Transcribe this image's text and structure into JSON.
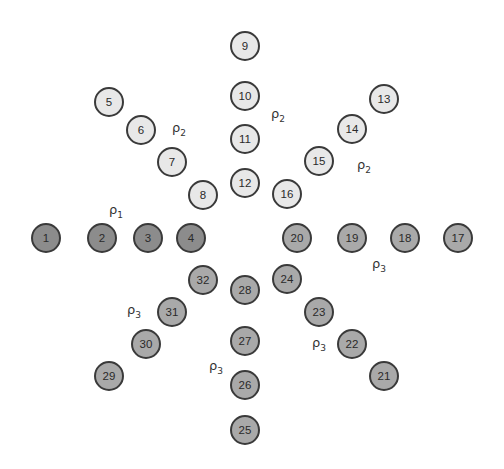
{
  "diagram": {
    "nodes": [
      {
        "id": "1",
        "x": 46,
        "y": 238,
        "shade": "dark"
      },
      {
        "id": "2",
        "x": 102,
        "y": 238,
        "shade": "dark"
      },
      {
        "id": "3",
        "x": 148,
        "y": 238,
        "shade": "dark"
      },
      {
        "id": "4",
        "x": 191,
        "y": 238,
        "shade": "dark"
      },
      {
        "id": "5",
        "x": 109,
        "y": 102,
        "shade": "light"
      },
      {
        "id": "6",
        "x": 141,
        "y": 130,
        "shade": "light"
      },
      {
        "id": "7",
        "x": 172,
        "y": 162,
        "shade": "light"
      },
      {
        "id": "8",
        "x": 203,
        "y": 195,
        "shade": "light"
      },
      {
        "id": "9",
        "x": 245,
        "y": 46,
        "shade": "light"
      },
      {
        "id": "10",
        "x": 245,
        "y": 96,
        "shade": "light"
      },
      {
        "id": "11",
        "x": 245,
        "y": 139,
        "shade": "light"
      },
      {
        "id": "12",
        "x": 245,
        "y": 183,
        "shade": "light"
      },
      {
        "id": "13",
        "x": 384,
        "y": 99,
        "shade": "light"
      },
      {
        "id": "14",
        "x": 352,
        "y": 129,
        "shade": "light"
      },
      {
        "id": "15",
        "x": 319,
        "y": 161,
        "shade": "light"
      },
      {
        "id": "16",
        "x": 287,
        "y": 194,
        "shade": "light"
      },
      {
        "id": "17",
        "x": 458,
        "y": 238,
        "shade": "mid"
      },
      {
        "id": "18",
        "x": 405,
        "y": 238,
        "shade": "mid"
      },
      {
        "id": "19",
        "x": 352,
        "y": 238,
        "shade": "mid"
      },
      {
        "id": "20",
        "x": 297,
        "y": 238,
        "shade": "mid"
      },
      {
        "id": "21",
        "x": 384,
        "y": 376,
        "shade": "mid"
      },
      {
        "id": "22",
        "x": 352,
        "y": 344,
        "shade": "mid"
      },
      {
        "id": "23",
        "x": 319,
        "y": 312,
        "shade": "mid"
      },
      {
        "id": "24",
        "x": 287,
        "y": 279,
        "shade": "mid"
      },
      {
        "id": "25",
        "x": 245,
        "y": 430,
        "shade": "mid"
      },
      {
        "id": "26",
        "x": 245,
        "y": 385,
        "shade": "mid"
      },
      {
        "id": "27",
        "x": 245,
        "y": 341,
        "shade": "mid"
      },
      {
        "id": "28",
        "x": 245,
        "y": 290,
        "shade": "mid"
      },
      {
        "id": "29",
        "x": 109,
        "y": 376,
        "shade": "mid"
      },
      {
        "id": "30",
        "x": 146,
        "y": 344,
        "shade": "mid"
      },
      {
        "id": "31",
        "x": 172,
        "y": 312,
        "shade": "mid"
      },
      {
        "id": "32",
        "x": 203,
        "y": 280,
        "shade": "mid"
      }
    ],
    "labels": [
      {
        "base": "ρ",
        "sub": "2",
        "x": 179,
        "y": 130
      },
      {
        "base": "ρ",
        "sub": "2",
        "x": 278,
        "y": 116
      },
      {
        "base": "ρ",
        "sub": "2",
        "x": 364,
        "y": 167
      },
      {
        "base": "ρ",
        "sub": "1",
        "x": 116,
        "y": 212
      },
      {
        "base": "ρ",
        "sub": "3",
        "x": 379,
        "y": 266
      },
      {
        "base": "ρ",
        "sub": "3",
        "x": 134,
        "y": 312
      },
      {
        "base": "ρ",
        "sub": "3",
        "x": 319,
        "y": 345
      },
      {
        "base": "ρ",
        "sub": "3",
        "x": 216,
        "y": 368
      }
    ],
    "colors": {
      "light": "#e8e8e8",
      "mid": "#a9a9a9",
      "dark": "#8c8c8c",
      "stroke": "#3a3a3a"
    }
  }
}
